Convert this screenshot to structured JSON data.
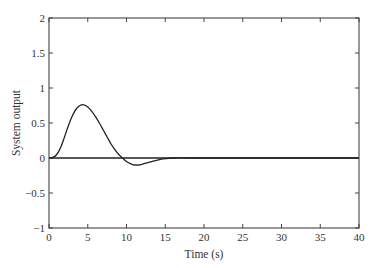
{
  "chart_data": {
    "type": "line",
    "title": "",
    "xlabel": "Time (s)",
    "ylabel": "System output",
    "xlim": [
      0,
      40
    ],
    "ylim": [
      -1,
      2
    ],
    "xticks": [
      0,
      5,
      10,
      15,
      20,
      25,
      30,
      35,
      40
    ],
    "xtick_labels": [
      "0",
      "5",
      "10",
      "15",
      "20",
      "25",
      "30",
      "35",
      "40"
    ],
    "yticks": [
      -1,
      -0.5,
      0,
      0.5,
      1,
      1.5,
      2
    ],
    "ytick_labels": [
      "−1",
      "−0.5",
      "0",
      "0.5",
      "1",
      "1.5",
      "2"
    ],
    "grid": false,
    "series": [
      {
        "name": "System output",
        "x": [
          0,
          0.5,
          1,
          1.5,
          2,
          2.5,
          3,
          3.5,
          4,
          4.5,
          5,
          5.5,
          6,
          6.5,
          7,
          7.5,
          8,
          8.5,
          9,
          9.5,
          10,
          10.5,
          11,
          11.5,
          12,
          13,
          14,
          15,
          16,
          18,
          20,
          25,
          30,
          35,
          40
        ],
        "y": [
          0,
          0.01,
          0.05,
          0.15,
          0.3,
          0.46,
          0.6,
          0.7,
          0.75,
          0.76,
          0.73,
          0.67,
          0.59,
          0.5,
          0.4,
          0.3,
          0.2,
          0.12,
          0.05,
          0.0,
          -0.05,
          -0.08,
          -0.1,
          -0.1,
          -0.09,
          -0.06,
          -0.03,
          -0.01,
          0,
          0,
          0,
          0,
          0,
          0,
          0
        ]
      },
      {
        "name": "Reference (zero)",
        "x": [
          0,
          40
        ],
        "y": [
          0,
          0
        ]
      }
    ]
  }
}
